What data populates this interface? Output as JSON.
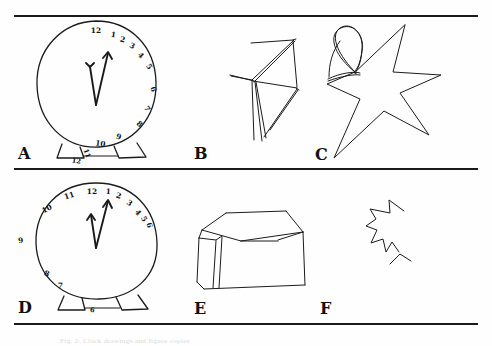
{
  "figure": {
    "background_color": "#fefefe",
    "ink_color": "#1b1b1b",
    "rule_color": "#1a1a1a",
    "caption": "Fig. 2. Clock drawings and figure copies"
  },
  "panels": [
    {
      "id": "A",
      "label": "A",
      "task": "clock-drawing",
      "description": "Large circular clock face with two trapezoid feet; numbers crowded along right side",
      "numbers_on_face": [
        "12",
        "1",
        "2",
        "3",
        "4",
        "5",
        "6",
        "7",
        "8",
        "9",
        "10"
      ],
      "numbers_outside_face": [
        "11",
        "12"
      ],
      "hands": 2
    },
    {
      "id": "B",
      "label": "B",
      "task": "figure-copy",
      "description": "Fragmented angular line drawing, crossing strokes, incomplete"
    },
    {
      "id": "C",
      "label": "C",
      "task": "figure-copy",
      "description": "Five-pointed star with an extra overlapping triangular loop at upper left"
    },
    {
      "id": "D",
      "label": "D",
      "task": "clock-drawing",
      "description": "Circular clock face with two feet; numbers 7-11 on left, 12-6 crowded on right",
      "numbers_on_face": [
        "12",
        "1",
        "2",
        "3",
        "4",
        "5",
        "11",
        "10",
        "9",
        "8",
        "7"
      ],
      "numbers_outside_face": [
        "6"
      ],
      "hands": 2
    },
    {
      "id": "E",
      "label": "E",
      "task": "figure-copy",
      "description": "Three-dimensional open box drawn in perspective"
    },
    {
      "id": "F",
      "label": "F",
      "task": "figure-copy",
      "description": "Small incomplete star fragment with detached stroke"
    }
  ],
  "clock_a": {
    "face_numbers": [
      {
        "text": "12",
        "x": 96,
        "y": 33,
        "rot": 0
      },
      {
        "text": "1",
        "x": 113,
        "y": 37,
        "rot": 8
      },
      {
        "text": "2",
        "x": 122,
        "y": 42,
        "rot": 15
      },
      {
        "text": "3",
        "x": 131,
        "y": 48,
        "rot": 28
      },
      {
        "text": "4",
        "x": 139,
        "y": 57,
        "rot": 45
      },
      {
        "text": "5",
        "x": 147,
        "y": 68,
        "rot": 58
      },
      {
        "text": "6",
        "x": 151,
        "y": 90,
        "rot": 72
      },
      {
        "text": "7",
        "x": 145,
        "y": 110,
        "rot": 58
      },
      {
        "text": "8",
        "x": 138,
        "y": 126,
        "rot": 40
      },
      {
        "text": "9",
        "x": 118,
        "y": 139,
        "rot": 18
      },
      {
        "text": "10",
        "x": 100,
        "y": 146,
        "rot": 8
      }
    ],
    "outside_numbers": [
      {
        "text": "11",
        "x": 85,
        "y": 154,
        "rot": 70
      },
      {
        "text": "12",
        "x": 76,
        "y": 163,
        "rot": 10
      }
    ]
  },
  "clock_d": {
    "face_numbers": [
      {
        "text": "12",
        "x": 92,
        "y": 194,
        "rot": 0
      },
      {
        "text": "1",
        "x": 108,
        "y": 194,
        "rot": 5
      },
      {
        "text": "2",
        "x": 118,
        "y": 198,
        "rot": 18
      },
      {
        "text": "3",
        "x": 128,
        "y": 205,
        "rot": 35
      },
      {
        "text": "4",
        "x": 136,
        "y": 214,
        "rot": 52
      },
      {
        "text": "5",
        "x": 142,
        "y": 220,
        "rot": 62
      },
      {
        "text": "6",
        "x": 147,
        "y": 226,
        "rot": 72
      },
      {
        "text": "11",
        "x": 70,
        "y": 198,
        "rot": -18
      },
      {
        "text": "10",
        "x": 48,
        "y": 211,
        "rot": -28
      },
      {
        "text": "9",
        "x": 21,
        "y": 243,
        "rot": -8
      },
      {
        "text": "8",
        "x": 46,
        "y": 276,
        "rot": 20
      },
      {
        "text": "7",
        "x": 60,
        "y": 288,
        "rot": 5
      }
    ],
    "outside_numbers": [
      {
        "text": "6",
        "x": 92,
        "y": 312,
        "rot": 8
      }
    ]
  },
  "labels": {
    "a": {
      "text": "A",
      "x": 18,
      "y": 146
    },
    "b": {
      "text": "B",
      "x": 194,
      "y": 146
    },
    "c": {
      "text": "C",
      "x": 315,
      "y": 147
    },
    "d": {
      "text": "D",
      "x": 18,
      "y": 300
    },
    "e": {
      "text": "E",
      "x": 194,
      "y": 301
    },
    "f": {
      "text": "F",
      "x": 320,
      "y": 301
    }
  }
}
